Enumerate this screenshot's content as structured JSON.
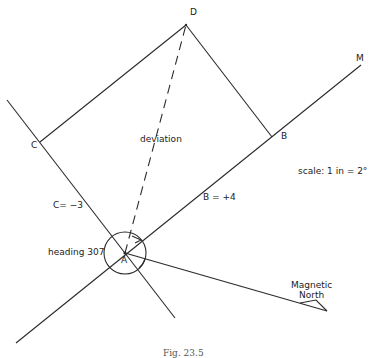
{
  "figure": {
    "caption": "Fig. 23.5",
    "scale_note": "scale: 1 in = 2°",
    "points": {
      "A": {
        "label": "A",
        "x": 125,
        "y": 253
      },
      "B": {
        "label": "B",
        "x": 272,
        "y": 137
      },
      "C": {
        "label": "C",
        "x": 40,
        "y": 142
      },
      "D": {
        "label": "D",
        "x": 186,
        "y": 25
      },
      "M": {
        "label": "M",
        "x": 361,
        "y": 65
      }
    },
    "labels": {
      "deviation": "deviation",
      "c_value": "C= −3",
      "b_value": "B = +4",
      "heading": "heading 307",
      "magnetic_north_line1": "Magnetic",
      "magnetic_north_line2": "North"
    },
    "colors": {
      "line": "#2a2a2a",
      "text": "#222222",
      "background": "#ffffff"
    }
  }
}
